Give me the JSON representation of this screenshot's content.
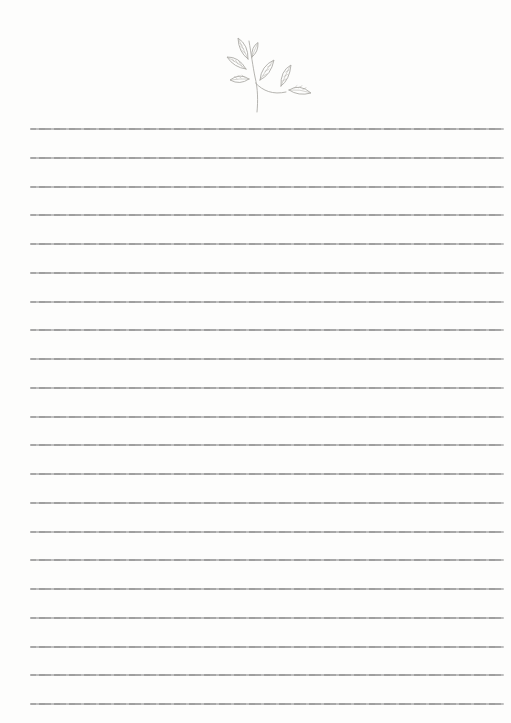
{
  "page": {
    "kind": "blank-lined-journal-page",
    "background_color": "#fdfdfc",
    "width_px": 511,
    "height_px": 723,
    "visible_text": ""
  },
  "illustration": {
    "name": "leaf-branch-sketch",
    "description": "hand-drawn pencil sketch of a twig with six leaves, top center of page",
    "stroke_color": "#adaba7"
  },
  "ruled_lines": {
    "count": 21,
    "color": "#a7a7a7",
    "thickness_px": 2,
    "first_line_y": 128,
    "spacing_px": 28.75,
    "left_x": 30,
    "right_x": 504
  }
}
